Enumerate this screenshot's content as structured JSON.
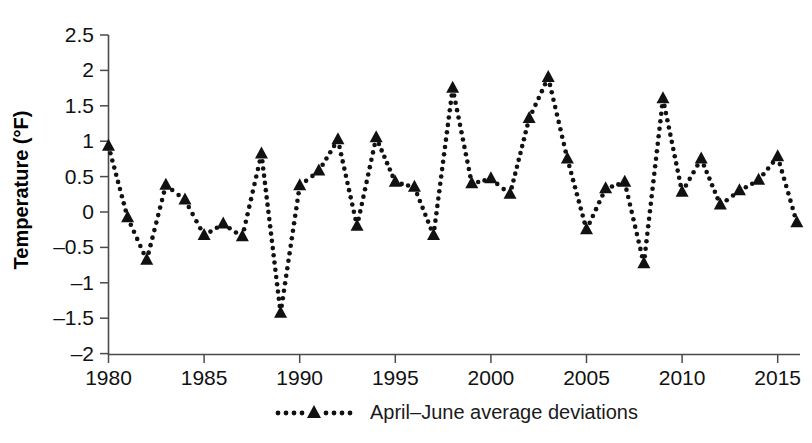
{
  "chart_data": {
    "type": "line",
    "title": "",
    "subtitle": "",
    "xlabel": "",
    "ylabel": "Temperature (°F)",
    "xlim": [
      1979.4,
      2016.6
    ],
    "ylim": [
      -2,
      2.5
    ],
    "grid": false,
    "legend_position": "bottom-center",
    "marker": "triangle",
    "linestyle": "dotted",
    "color": "#111111",
    "xticks": [
      1980,
      1985,
      1990,
      1995,
      2000,
      2005,
      2010,
      2015
    ],
    "xtick_labels": [
      "1980",
      "1985",
      "1990",
      "1995",
      "2000",
      "2005",
      "2010",
      "2015"
    ],
    "yticks": [
      -2,
      -1.5,
      -1,
      -0.5,
      0,
      0.5,
      1,
      1.5,
      2,
      2.5
    ],
    "ytick_labels": [
      "–2",
      "–1.5",
      "–1",
      "–0.5",
      "0",
      "0.5",
      "1",
      "1.5",
      "2",
      "2.5"
    ],
    "series": [
      {
        "name": "April–June average deviations",
        "x": [
          1980,
          1981,
          1982,
          1983,
          1984,
          1985,
          1986,
          1987,
          1988,
          1989,
          1990,
          1991,
          1992,
          1993,
          1994,
          1995,
          1996,
          1997,
          1998,
          1999,
          2000,
          2001,
          2002,
          2003,
          2004,
          2005,
          2006,
          2007,
          2008,
          2009,
          2010,
          2011,
          2012,
          2013,
          2014,
          2015,
          2016
        ],
        "values": [
          0.93,
          -0.08,
          -0.68,
          0.38,
          0.17,
          -0.33,
          -0.17,
          -0.35,
          0.82,
          -1.43,
          0.37,
          0.58,
          1.02,
          -0.2,
          1.05,
          0.42,
          0.35,
          -0.33,
          1.75,
          0.4,
          0.47,
          0.25,
          1.32,
          1.9,
          0.75,
          -0.25,
          0.33,
          0.42,
          -0.73,
          1.6,
          0.28,
          0.75,
          0.1,
          0.3,
          0.45,
          0.78,
          -0.15
        ]
      }
    ]
  },
  "legend": {
    "entries": [
      {
        "label": "April–June average deviations",
        "marker": "triangle",
        "linestyle": "dotted"
      }
    ]
  },
  "axes": {
    "y_title": "Temperature (°F)"
  }
}
